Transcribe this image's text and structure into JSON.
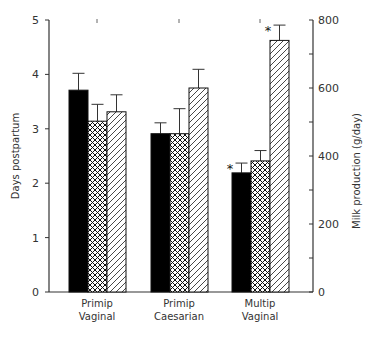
{
  "chart_data": {
    "type": "bar",
    "title": "",
    "categories": [
      "Primip Vaginal",
      "Primip Caesarian",
      "Multip Vaginal"
    ],
    "category_lines": [
      [
        "Primip",
        "Vaginal"
      ],
      [
        "Primip",
        "Caesarian"
      ],
      [
        "Multip",
        "Vaginal"
      ]
    ],
    "ylabel": "Days postpartum",
    "ylabel_right": "Milk production (g/day)",
    "ylim": [
      0,
      5
    ],
    "ylim_right": [
      0,
      800
    ],
    "yticks": [
      "0",
      "1",
      "2",
      "3",
      "4",
      "5"
    ],
    "yticks_right": [
      "0",
      "200",
      "400",
      "600",
      "800"
    ],
    "grid": false,
    "legend": "none",
    "series": [
      {
        "name": "Series 1 (solid black)",
        "axis": "left",
        "pattern": "solid",
        "values": [
          3.71,
          2.91,
          2.19
        ],
        "errors": [
          0.31,
          0.2,
          0.18
        ],
        "significant": [
          false,
          false,
          true
        ]
      },
      {
        "name": "Series 2 (cross-hatched)",
        "axis": "left",
        "pattern": "crosshatch",
        "values": [
          3.14,
          2.91,
          2.41
        ],
        "errors": [
          0.31,
          0.46,
          0.19
        ],
        "significant": [
          false,
          false,
          false
        ]
      },
      {
        "name": "Series 3 (diagonal hatched)",
        "axis": "right",
        "pattern": "diagonal",
        "values": [
          530,
          600,
          740
        ],
        "errors": [
          50,
          55,
          45
        ],
        "significant": [
          false,
          false,
          true
        ]
      }
    ],
    "annotations": [
      "*",
      "*"
    ]
  }
}
